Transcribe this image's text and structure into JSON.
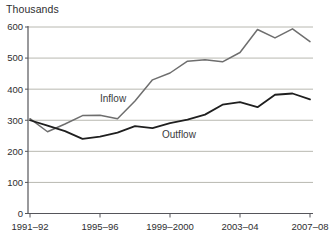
{
  "chart_data": {
    "type": "line",
    "title": "",
    "unit_label": "Thousands",
    "xlabel": "",
    "ylabel": "Thousands",
    "categories": [
      "1991–92",
      "1992–93",
      "1993–94",
      "1994–95",
      "1995–96",
      "1996–97",
      "1997–98",
      "1998–99",
      "1999–2000",
      "2000–01",
      "2001–02",
      "2002–03",
      "2003–04",
      "2004–05",
      "2005–06",
      "2006–07",
      "2007–08"
    ],
    "x_tick_labels": [
      "1991–92",
      "1995–96",
      "1999–2000",
      "2003–04",
      "2007–08"
    ],
    "x_tick_indices": [
      0,
      4,
      8,
      12,
      16
    ],
    "y_ticks": [
      0,
      100,
      200,
      300,
      400,
      500,
      600
    ],
    "ylim": [
      0,
      600
    ],
    "grid": true,
    "legend_position": "inline-annotations",
    "series": [
      {
        "name": "Inflow",
        "color": "#6e6e6e",
        "values": [
          305,
          263,
          288,
          315,
          316,
          305,
          362,
          430,
          452,
          490,
          495,
          488,
          518,
          592,
          565,
          594,
          553
        ]
      },
      {
        "name": "Outflow",
        "color": "#1f1f1f",
        "values": [
          300,
          283,
          265,
          240,
          247,
          260,
          281,
          275,
          291,
          302,
          318,
          350,
          358,
          342,
          382,
          386,
          367
        ]
      }
    ],
    "colors": {
      "grid": "#b8b8b0",
      "axis": "#55555a",
      "text": "#2e2e30",
      "background": "#ffffff"
    }
  }
}
